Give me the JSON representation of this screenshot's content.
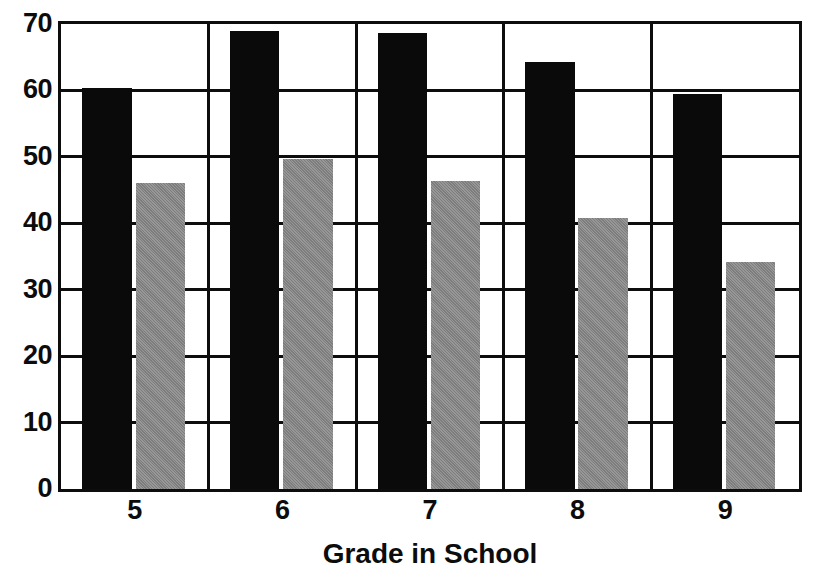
{
  "chart_data": {
    "type": "bar",
    "title": "",
    "xlabel": "Grade in School",
    "ylabel": "",
    "categories": [
      "5",
      "6",
      "7",
      "8",
      "9"
    ],
    "series": [
      {
        "name": "series-dark",
        "color": "#0a0a0a",
        "values": [
          60.4,
          68.9,
          68.6,
          64.3,
          59.4
        ]
      },
      {
        "name": "series-gray",
        "color": "#8b8b8b",
        "values": [
          46.0,
          49.7,
          46.3,
          40.8,
          34.2
        ]
      }
    ],
    "ylim": [
      0,
      70
    ],
    "ytick_step": 10,
    "yticks": [
      "0",
      "10",
      "20",
      "30",
      "40",
      "50",
      "60",
      "70"
    ],
    "grid": "horizontal-and-group-separators",
    "legend": "none"
  },
  "axes": {
    "x_title": "Grade in School"
  }
}
